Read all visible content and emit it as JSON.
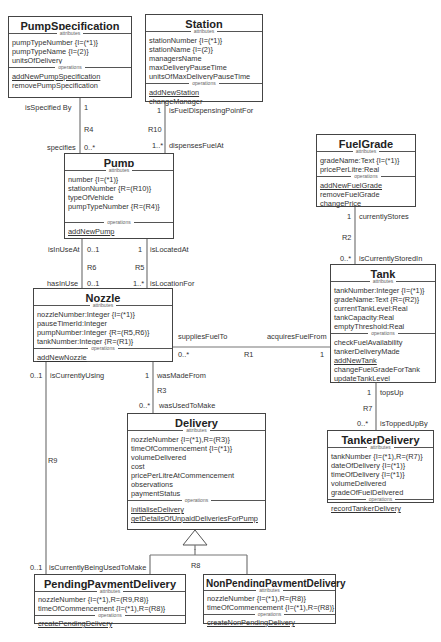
{
  "classes": {
    "pumpSpecification": {
      "name": "PumpSpecification",
      "attributes_caption": "attributes",
      "attributes": [
        "pumpTypeNumber {I=(*1)}",
        "pumpTypeName {I=(2)}",
        "unitsOfDelivery"
      ],
      "operations_caption": "operations",
      "operations": [
        "addNewPumpSpecification",
        "removePumpSpecification"
      ]
    },
    "station": {
      "name": "Station",
      "attributes_caption": "attributes",
      "attributes": [
        "stationNumber {I=(*1)}",
        "stationName {I=(2)}",
        "managersName",
        "maxDeliveryPauseTime",
        "unitsOfMaxDeliveryPauseTime"
      ],
      "operations_caption": "operations",
      "operations": [
        "addNewStation",
        "changeManager"
      ]
    },
    "fuelGrade": {
      "name": "FuelGrade",
      "attributes_caption": "attributes",
      "attributes": [
        "gradeName:Text {I=(*1)}",
        "pricePerLitre:Real"
      ],
      "operations_caption": "operations",
      "operations": [
        "addNewFuelGrade",
        "removeFuelGrade",
        "changePrice"
      ]
    },
    "pump": {
      "name": "Pump",
      "attributes_caption": "attributes",
      "attributes": [
        "number {I=(*1)}",
        "stationNumber {R=(R10)}",
        "typeOfVehicle",
        "pumpTypeNumber {R=(R4)}"
      ],
      "operations_caption": "operations",
      "operations": [
        "addNewPump"
      ]
    },
    "tank": {
      "name": "Tank",
      "attributes_caption": "attributes",
      "attributes": [
        "tankNumber:Integer {I=(*1)}",
        "gradeName:Text {R=(R2)}",
        "currentTankLevel:Real",
        "tankCapacity:Real",
        "emptyThreshold:Real"
      ],
      "operations_caption": "operations",
      "operations": [
        "checkFuelAvailability",
        "tankerDeliveryMade",
        "addNewTank",
        "changeFuelGradeForTank",
        "updateTankLevel"
      ]
    },
    "nozzle": {
      "name": "Nozzle",
      "attributes_caption": "attributes",
      "attributes": [
        "nozzleNumber:Integer {I=(*1)}",
        "pauseTimerId:Integer",
        "pumpNumber:Integer {R=(R5,R6)}",
        "tankNumber:Integer {R=(R1)}"
      ],
      "operations_caption": "operations",
      "operations": [
        "addNewNozzle"
      ]
    },
    "delivery": {
      "name": "Delivery",
      "attributes_caption": "attributes",
      "attributes": [
        "nozzleNumber {I=(*1),R=(R3)}",
        "timeOfCommencement {I=(*1)}",
        "volumeDelivered",
        "cost",
        "pricePerLitreAtCommencement",
        "observations",
        "paymentStatus"
      ],
      "operations_caption": "operations",
      "operations": [
        "initialiseDelivery",
        "getDetailsOfUnpaidDeliveriesForPump"
      ]
    },
    "tankerDelivery": {
      "name": "TankerDelivery",
      "attributes_caption": "attributes",
      "attributes": [
        "tankNumber {I=(*1),R=(R7)}",
        "dateOfDelivery {I=(*1)}",
        "timeOfDelivery {I=(*1)}",
        "volumeDelivered",
        "gradeOfFuelDelivered"
      ],
      "operations_caption": "operations",
      "operations": [
        "recordTankerDelivery"
      ]
    },
    "pendingPaymentDelivery": {
      "name": "PendingPaymentDelivery",
      "attributes_caption": "attributes",
      "attributes": [
        "nozzleNumber {I=(*1),R=(R9,R8)}",
        "timeOfCommencement {I=(*1),R=(R8)}"
      ],
      "operations_caption": "operations",
      "operations": [
        "createPendingDelivery"
      ]
    },
    "nonPendingPaymentDelivery": {
      "name": "NonPendingPaymentDelivery",
      "attributes_caption": "attributes",
      "attributes": [
        "nozzleNumber {I=(*1),R=(R8)}",
        "timeOfCommencement {I=(*1),R=(R8)}"
      ],
      "operations_caption": "operations",
      "operations": [
        "createNonPendingDelivery"
      ]
    }
  },
  "associations": {
    "r4": {
      "id": "R4",
      "top_role": "isSpecified By",
      "top_mult": "1",
      "bottom_role": "specifies",
      "bottom_mult": "0..*"
    },
    "r10": {
      "id": "R10",
      "top_role": "isFuelDispensingPointFor",
      "top_mult": "1",
      "bottom_role": "dispensesFuelAt",
      "bottom_mult": "1..*"
    },
    "r2": {
      "id": "R2",
      "top_role": "currentlyStores",
      "top_mult": "1",
      "bottom_role": "isCurrentlyStoredIn",
      "bottom_mult": "0..*"
    },
    "r6": {
      "id": "R6",
      "top_role": "isInUseAt",
      "top_mult": "0..1",
      "bottom_role": "hasInUse",
      "bottom_mult": "0..1"
    },
    "r5": {
      "id": "R5",
      "top_role": "isLocatedAt",
      "top_mult": "1",
      "bottom_role": "isLocationFor",
      "bottom_mult": "1..*"
    },
    "r1": {
      "id": "R1",
      "left_role": "suppliesFuelTo",
      "left_mult": "0..*",
      "right_role": "acquiresFuelFrom",
      "right_mult": "1"
    },
    "r3": {
      "id": "R3",
      "top_role": "wasMadeFrom",
      "top_mult": "1",
      "bottom_role": "wasUsedToMake",
      "bottom_mult": "0..*"
    },
    "r7": {
      "id": "R7",
      "top_role": "topsUp",
      "top_mult": "1",
      "bottom_role": "isToppedUpBy",
      "bottom_mult": "0..*"
    },
    "r9": {
      "id": "R9",
      "top_role": "isCurrentlyUsing",
      "top_mult": "0..1",
      "bottom_role": "isCurrentlyBeingUsedToMake",
      "bottom_mult": "0..1"
    },
    "r8": {
      "id": "R8"
    }
  }
}
